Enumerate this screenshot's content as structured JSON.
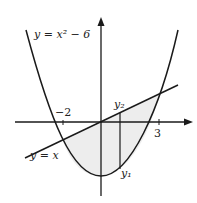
{
  "curves": {
    "parabola_label": "y = x² − 6",
    "line_label": "y = x"
  },
  "ticks": {
    "neg_two": "−2",
    "three": "3"
  },
  "points": {
    "y2": "y₂",
    "y1": "y₁"
  },
  "colors": {
    "stroke": "#1a1a1a",
    "shade": "#e8e8e8"
  }
}
